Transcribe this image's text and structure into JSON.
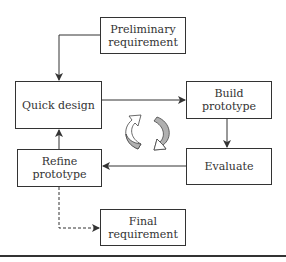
{
  "diagram": {
    "nodes": {
      "preliminary": {
        "label_line1": "Preliminary",
        "label_line2": "requirement"
      },
      "quick_design": {
        "label": "Quick design"
      },
      "build": {
        "label_line1": "Build",
        "label_line2": "prototype"
      },
      "evaluate": {
        "label": "Evaluate"
      },
      "refine": {
        "label_line1": "Refine",
        "label_line2": "prototype"
      },
      "final": {
        "label_line1": "Final",
        "label_line2": "requirement"
      }
    },
    "edges": [
      {
        "from": "Preliminary requirement",
        "to": "Quick design",
        "style": "solid"
      },
      {
        "from": "Quick design",
        "to": "Build prototype",
        "style": "solid"
      },
      {
        "from": "Build prototype",
        "to": "Evaluate",
        "style": "solid"
      },
      {
        "from": "Evaluate",
        "to": "Refine prototype",
        "style": "solid"
      },
      {
        "from": "Refine prototype",
        "to": "Quick design",
        "style": "solid"
      },
      {
        "from": "Refine prototype",
        "to": "Final requirement",
        "style": "dashed"
      }
    ],
    "center_icon": "cycle-arrows-icon",
    "colors": {
      "stroke": "#333333",
      "icon_fill": "#b0b0b0"
    }
  }
}
